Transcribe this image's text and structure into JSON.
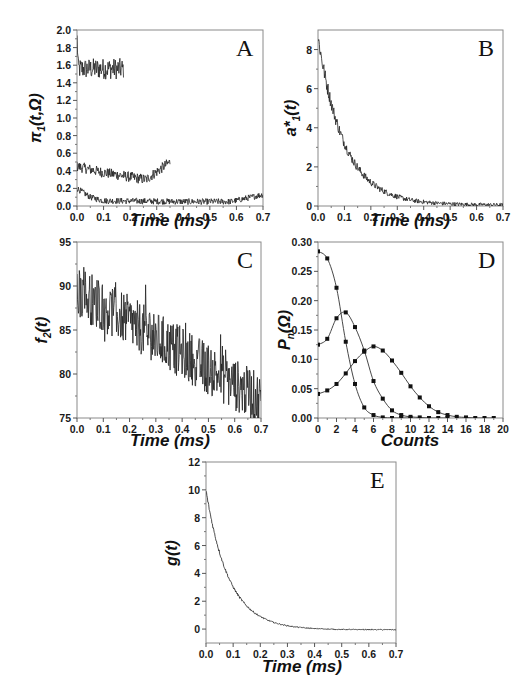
{
  "chart_data": [
    {
      "panel": "A",
      "type": "line",
      "xlabel": "Time (ms)",
      "ylabel": "π1(t,Ω)",
      "xlim": [
        0.0,
        0.7
      ],
      "ylim": [
        0.0,
        2.0
      ],
      "xticks": [
        "0.0",
        "0.1",
        "0.2",
        "0.3",
        "0.4",
        "0.5",
        "0.6",
        "0.7"
      ],
      "yticks": [
        "0.0",
        "0.2",
        "0.4",
        "0.6",
        "0.8",
        "1.0",
        "1.2",
        "1.4",
        "1.6",
        "1.8",
        "2.0"
      ],
      "series": [
        {
          "name": "high",
          "x_range": [
            0.0,
            0.175
          ],
          "mean": 1.56,
          "noise": 0.12,
          "start": 1.9
        },
        {
          "name": "mid",
          "x_range": [
            0.0,
            0.35
          ],
          "mean_points": [
            [
              0.0,
              0.45
            ],
            [
              0.1,
              0.38
            ],
            [
              0.2,
              0.33
            ],
            [
              0.26,
              0.3
            ],
            [
              0.35,
              0.5
            ]
          ],
          "noise": 0.06
        },
        {
          "name": "low",
          "x_range": [
            0.0,
            0.7
          ],
          "mean_points": [
            [
              0.0,
              0.2
            ],
            [
              0.05,
              0.1
            ],
            [
              0.1,
              0.06
            ],
            [
              0.4,
              0.05
            ],
            [
              0.58,
              0.05
            ],
            [
              0.7,
              0.13
            ]
          ],
          "noise": 0.035
        }
      ]
    },
    {
      "panel": "B",
      "type": "line",
      "xlabel": "Time (ms)",
      "ylabel": "a*1(t)",
      "xlim": [
        0.0,
        0.7
      ],
      "ylim": [
        0,
        9
      ],
      "xticks": [
        "0.0",
        "0.1",
        "0.2",
        "0.3",
        "0.4",
        "0.5",
        "0.6",
        "0.7"
      ],
      "yticks": [
        "0",
        "2",
        "4",
        "6",
        "8"
      ],
      "series": [
        {
          "name": "a*1",
          "model": "exp_decay",
          "amplitude": 8.6,
          "tau_ms": 0.1,
          "offset": 0.05,
          "noise": 0.35
        }
      ]
    },
    {
      "panel": "C",
      "type": "line",
      "xlabel": "Time (ms)",
      "ylabel": "f2(t)",
      "xlim": [
        0.0,
        0.7
      ],
      "ylim": [
        75,
        95
      ],
      "xticks": [
        "0.0",
        "0.1",
        "0.2",
        "0.3",
        "0.4",
        "0.5",
        "0.6",
        "0.7"
      ],
      "yticks": [
        "75",
        "80",
        "85",
        "90",
        "95"
      ],
      "series": [
        {
          "name": "f2",
          "model": "linear_trend",
          "start": 89.5,
          "end": 77.0,
          "noise": 3.0
        }
      ]
    },
    {
      "panel": "D",
      "type": "line",
      "xlabel": "Counts",
      "ylabel": "Pn(Ω)",
      "xlim": [
        0,
        20
      ],
      "ylim": [
        0.0,
        0.3
      ],
      "xticks": [
        "0",
        "2",
        "4",
        "6",
        "8",
        "10",
        "12",
        "14",
        "16",
        "18",
        "20"
      ],
      "yticks": [
        "0.00",
        "0.05",
        "0.10",
        "0.15",
        "0.20",
        "0.25",
        "0.30"
      ],
      "series": [
        {
          "name": "short window",
          "x": [
            0,
            1,
            2,
            3,
            4,
            5,
            6,
            7,
            8,
            9,
            10
          ],
          "values": [
            0.284,
            0.272,
            0.222,
            0.13,
            0.058,
            0.018,
            0.005,
            0.001,
            0.0,
            0.0,
            0.0
          ]
        },
        {
          "name": "medium window",
          "x": [
            0,
            1,
            2,
            3,
            4,
            5,
            6,
            7,
            8,
            9,
            10,
            11,
            12,
            13,
            14
          ],
          "values": [
            0.125,
            0.135,
            0.17,
            0.18,
            0.155,
            0.115,
            0.063,
            0.033,
            0.013,
            0.005,
            0.002,
            0.001,
            0.0,
            0.0,
            0.0
          ]
        },
        {
          "name": "long window",
          "x": [
            0,
            1,
            2,
            3,
            4,
            5,
            6,
            7,
            8,
            9,
            10,
            11,
            12,
            13,
            14,
            15,
            16,
            17,
            18,
            19
          ],
          "values": [
            0.041,
            0.047,
            0.058,
            0.076,
            0.097,
            0.113,
            0.122,
            0.115,
            0.098,
            0.077,
            0.054,
            0.035,
            0.02,
            0.01,
            0.005,
            0.002,
            0.001,
            0.0,
            0.0,
            0.0
          ]
        }
      ]
    },
    {
      "panel": "E",
      "type": "line",
      "xlabel": "Time (ms)",
      "ylabel": "g(t)",
      "xlim": [
        0.0,
        0.7
      ],
      "ylim": [
        -1,
        12
      ],
      "xticks": [
        "0.0",
        "0.1",
        "0.2",
        "0.3",
        "0.4",
        "0.5",
        "0.6",
        "0.7"
      ],
      "yticks": [
        "0",
        "2",
        "4",
        "6",
        "8",
        "10",
        "12"
      ],
      "series": [
        {
          "name": "g",
          "model": "exp_decay",
          "amplitude": 10.0,
          "tau_ms": 0.085,
          "offset": -0.05,
          "noise": 0.12
        }
      ]
    }
  ],
  "panels": {
    "A": {
      "label": "A",
      "xlabel": "Time (ms)",
      "ylabel_main": "π",
      "ylabel_sub": "1",
      "ylabel_tail": "(t,Ω)"
    },
    "B": {
      "label": "B",
      "xlabel": "Time (ms)",
      "ylabel_main": "a*",
      "ylabel_sub": "1",
      "ylabel_tail": "(t)"
    },
    "C": {
      "label": "C",
      "xlabel": "Time (ms)",
      "ylabel_main": "f",
      "ylabel_sub": "2",
      "ylabel_tail": "(t)"
    },
    "D": {
      "label": "D",
      "xlabel": "Counts",
      "ylabel_main": "P",
      "ylabel_sub": "n",
      "ylabel_tail": "(Ω)"
    },
    "E": {
      "label": "E",
      "xlabel": "Time (ms)",
      "ylabel_main": "g(t)",
      "ylabel_sub": "",
      "ylabel_tail": ""
    }
  }
}
